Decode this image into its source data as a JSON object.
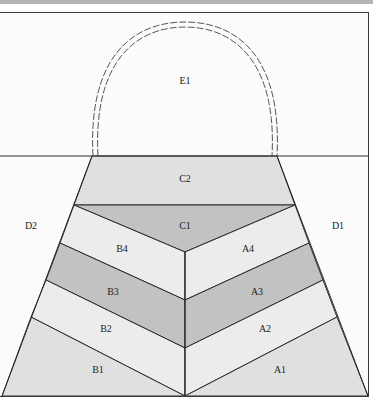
{
  "colors": {
    "background": "#fbfbfb",
    "light": "#ececec",
    "medium": "#dedede",
    "dark": "#c2c2c2",
    "line": "#2a2a2a",
    "topbar": "#b4b4b4"
  },
  "sections": {
    "E1": "E1",
    "C2": "C2",
    "C1": "C1",
    "D1": "D1",
    "D2": "D2",
    "A1": "A1",
    "A2": "A2",
    "A3": "A3",
    "A4": "A4",
    "B1": "B1",
    "B2": "B2",
    "B3": "B3",
    "B4": "B4"
  }
}
